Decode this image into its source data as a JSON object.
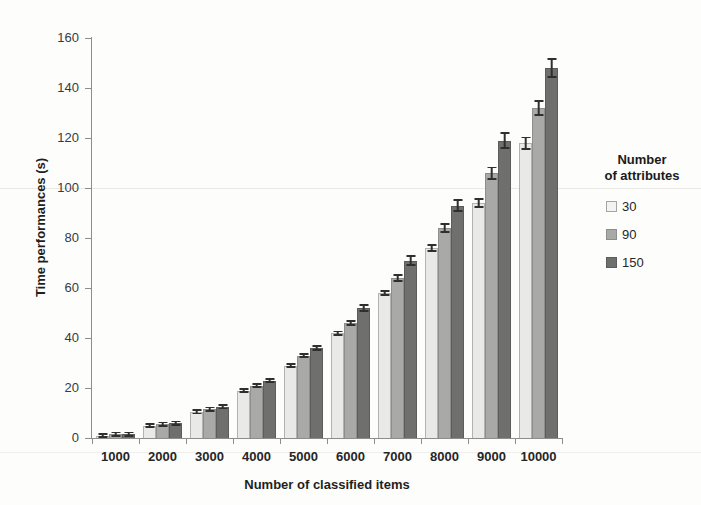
{
  "chart_data": {
    "type": "bar",
    "title": "",
    "xlabel": "Number of classified items",
    "ylabel": "Time performances (s)",
    "categories": [
      "1000",
      "2000",
      "3000",
      "4000",
      "5000",
      "6000",
      "7000",
      "8000",
      "9000",
      "10000"
    ],
    "series": [
      {
        "name": "30",
        "color": "#e9e9e7",
        "values": [
          1,
          5,
          10.5,
          19,
          29,
          42,
          58,
          76,
          94,
          118
        ],
        "errors": [
          0.4,
          0.5,
          0.6,
          0.7,
          0.8,
          1.0,
          1.2,
          1.6,
          2.0,
          2.6
        ]
      },
      {
        "name": "90",
        "color": "#a9a9a7",
        "values": [
          1.5,
          5.5,
          11.5,
          21,
          33,
          46,
          64,
          84,
          106,
          132
        ],
        "errors": [
          0.4,
          0.5,
          0.6,
          0.8,
          1.0,
          1.2,
          1.6,
          2.0,
          2.6,
          3.2
        ]
      },
      {
        "name": "150",
        "color": "#6f6f6d",
        "values": [
          1.5,
          6,
          12.5,
          23,
          36,
          52,
          71,
          93,
          119,
          148
        ],
        "errors": [
          0.4,
          0.6,
          0.8,
          1.0,
          1.2,
          1.6,
          2.2,
          2.6,
          3.4,
          4.0
        ]
      }
    ],
    "ylim": [
      0,
      160
    ],
    "yticks": [
      0,
      20,
      40,
      60,
      80,
      100,
      120,
      140,
      160
    ],
    "grid": false,
    "legend": {
      "position": "right",
      "title_line1": "Number",
      "title_line2": "of attributes",
      "entries": [
        "30",
        "90",
        "150"
      ]
    }
  }
}
